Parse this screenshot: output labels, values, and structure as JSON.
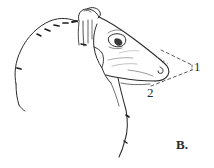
{
  "figure": {
    "panel_label": "B.",
    "background_color": "#ffffff",
    "ink_color": "#2b2b2b",
    "faint_ink_color": "#6f6f6f",
    "dashed_color": "#5a5a5a",
    "width": 214,
    "height": 168
  },
  "annotations": {
    "measure_1": {
      "label": "1",
      "x": 194,
      "y": 60,
      "description": "angle-of-muzzle-upper-measurement"
    },
    "measure_2": {
      "label": "2",
      "x": 147,
      "y": 86,
      "description": "angle-of-muzzle-lower-measurement"
    }
  },
  "guide_lines": [
    {
      "name": "dashed-guide-upper",
      "from": [
        161,
        50
      ],
      "to": [
        192,
        65
      ],
      "style": "dashed"
    },
    {
      "name": "dashed-guide-lower",
      "from": [
        151,
        86
      ],
      "to": [
        192,
        70
      ],
      "style": "dashed"
    },
    {
      "name": "dashed-guide-vertex",
      "from": [
        192,
        65
      ],
      "to": [
        192,
        70
      ],
      "style": "dashed"
    }
  ],
  "anatomy_parts": [
    "nape-and-neck-crest",
    "ear",
    "horn-base",
    "forehead",
    "eye",
    "cheek",
    "muzzle",
    "nostril",
    "mouth-line",
    "chin-beard",
    "throat"
  ]
}
